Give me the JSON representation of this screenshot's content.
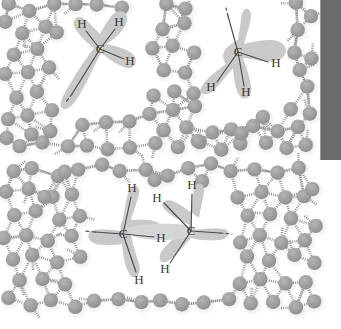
{
  "figure": {
    "width": 341,
    "height": 329,
    "background": "#ffffff",
    "colors": {
      "water_sphere": "#9d9d9d",
      "water_halo": "#d8d8d8",
      "hydration_cage": "#c9c9c9",
      "hydration_cage_inner": "#d5d5d5",
      "bond": "#4a4a4a",
      "hydrogen_bond": "#8f8f8f",
      "label_text": "#3a3a3a",
      "edge_bar": "#6b6b6b"
    }
  },
  "panels": [
    {
      "id": "top-panel",
      "name": "two-separate-methyl-groups-in-water",
      "bounds": {
        "x": 0,
        "y": 0,
        "width": 320,
        "height": 158
      },
      "molecules": [
        {
          "id": "top-left-molecule",
          "center": {
            "x": 100,
            "y": 49
          },
          "carbon_label": "C",
          "hydrogens": [
            {
              "label": "H",
              "x": 82,
              "y": 25
            },
            {
              "label": "H",
              "x": 118,
              "y": 23
            },
            {
              "label": "H",
              "x": 129,
              "y": 61
            }
          ],
          "open_bond": {
            "x": 68,
            "y": 99,
            "style": "dashed-continuation"
          }
        },
        {
          "id": "top-right-molecule",
          "center": {
            "x": 238,
            "y": 52
          },
          "carbon_label": "C",
          "hydrogens": [
            {
              "label": "H",
              "x": 275,
              "y": 64
            },
            {
              "label": "H",
              "x": 211,
              "y": 87
            },
            {
              "label": "H",
              "x": 245,
              "y": 92
            }
          ],
          "open_bond": {
            "x": 227,
            "y": 11,
            "style": "dashed-continuation"
          }
        }
      ]
    },
    {
      "id": "bottom-panel",
      "name": "two-bonded-carbons-in-water",
      "bounds": {
        "x": 0,
        "y": 162,
        "width": 320,
        "height": 158
      },
      "molecules": [
        {
          "id": "bottom-left-carbon",
          "center": {
            "x": 123,
            "y": 234
          },
          "carbon_label": "C",
          "hydrogens": [
            {
              "label": "H",
              "x": 132,
              "y": 190
            },
            {
              "label": "H",
              "x": 161,
              "y": 239
            },
            {
              "label": "H",
              "x": 139,
              "y": 280
            }
          ],
          "open_bond": {
            "x": 83,
            "y": 231,
            "style": "dashed-continuation"
          }
        },
        {
          "id": "bottom-right-carbon",
          "center": {
            "x": 191,
            "y": 231
          },
          "carbon_label": "C",
          "hydrogens": [
            {
              "label": "H",
              "x": 192,
              "y": 186
            },
            {
              "label": "H",
              "x": 157,
              "y": 200
            },
            {
              "label": "H",
              "x": 165,
              "y": 270
            }
          ],
          "open_bond": {
            "x": 231,
            "y": 234,
            "style": "dashed-continuation"
          }
        }
      ]
    }
  ],
  "labels": {
    "carbon": "C",
    "hydrogen": "H"
  },
  "edge_bar": {
    "name": "page-edge-artifact",
    "x": 320,
    "y": 0,
    "width": 21,
    "height": 160,
    "color": "#6b6b6b"
  },
  "water": {
    "sphere_radius": 7.2,
    "halo_radius": 9.4,
    "count_top": 96,
    "count_bottom": 96,
    "top_positions": [
      [
        10,
        6
      ],
      [
        31,
        12
      ],
      [
        54,
        6
      ],
      [
        76,
        3
      ],
      [
        98,
        5
      ],
      [
        20,
        32
      ],
      [
        44,
        27
      ],
      [
        12,
        53
      ],
      [
        35,
        48
      ],
      [
        58,
        30
      ],
      [
        4,
        75
      ],
      [
        27,
        70
      ],
      [
        50,
        66
      ],
      [
        15,
        96
      ],
      [
        38,
        92
      ],
      [
        60,
        88
      ],
      [
        8,
        118
      ],
      [
        30,
        113
      ],
      [
        52,
        110
      ],
      [
        74,
        106
      ],
      [
        96,
        103
      ],
      [
        118,
        99
      ],
      [
        140,
        95
      ],
      [
        84,
        127
      ],
      [
        106,
        123
      ],
      [
        128,
        120
      ],
      [
        150,
        116
      ],
      [
        172,
        112
      ],
      [
        194,
        108
      ],
      [
        120,
        6
      ],
      [
        142,
        10
      ],
      [
        164,
        4
      ],
      [
        186,
        8
      ],
      [
        208,
        3
      ],
      [
        230,
        7
      ],
      [
        252,
        4
      ],
      [
        274,
        9
      ],
      [
        296,
        5
      ],
      [
        163,
        28
      ],
      [
        185,
        24
      ],
      [
        207,
        30
      ],
      [
        229,
        26
      ],
      [
        296,
        28
      ],
      [
        152,
        49
      ],
      [
        174,
        45
      ],
      [
        196,
        51
      ],
      [
        273,
        31
      ],
      [
        295,
        52
      ],
      [
        141,
        72
      ],
      [
        163,
        68
      ],
      [
        185,
        74
      ],
      [
        207,
        70
      ],
      [
        276,
        76
      ],
      [
        298,
        72
      ],
      [
        152,
        94
      ],
      [
        174,
        90
      ],
      [
        196,
        96
      ],
      [
        218,
        92
      ],
      [
        240,
        88
      ],
      [
        262,
        94
      ],
      [
        284,
        90
      ],
      [
        306,
        86
      ],
      [
        166,
        131
      ],
      [
        188,
        127
      ],
      [
        210,
        133
      ],
      [
        232,
        129
      ],
      [
        254,
        125
      ],
      [
        276,
        131
      ],
      [
        298,
        127
      ],
      [
        66,
        148
      ],
      [
        88,
        144
      ],
      [
        110,
        150
      ],
      [
        132,
        146
      ],
      [
        154,
        142
      ],
      [
        176,
        148
      ],
      [
        198,
        144
      ],
      [
        220,
        150
      ],
      [
        242,
        146
      ],
      [
        264,
        142
      ],
      [
        286,
        148
      ],
      [
        308,
        144
      ],
      [
        44,
        140
      ],
      [
        22,
        145
      ],
      [
        5,
        138
      ],
      [
        308,
        112
      ],
      [
        310,
        60
      ],
      [
        312,
        14
      ],
      [
        252,
        46
      ],
      [
        262,
        116
      ],
      [
        240,
        134
      ],
      [
        196,
        140
      ],
      [
        74,
        50
      ],
      [
        96,
        76
      ],
      [
        118,
        56
      ],
      [
        7,
        22
      ],
      [
        52,
        130
      ],
      [
        30,
        135
      ],
      [
        292,
        110
      ]
    ],
    "bottom_positions": [
      [
        12,
        172
      ],
      [
        34,
        168
      ],
      [
        56,
        174
      ],
      [
        78,
        170
      ],
      [
        100,
        166
      ],
      [
        122,
        172
      ],
      [
        144,
        168
      ],
      [
        166,
        174
      ],
      [
        188,
        170
      ],
      [
        210,
        166
      ],
      [
        232,
        172
      ],
      [
        254,
        168
      ],
      [
        276,
        174
      ],
      [
        298,
        170
      ],
      [
        6,
        194
      ],
      [
        28,
        190
      ],
      [
        50,
        196
      ],
      [
        72,
        192
      ],
      [
        240,
        196
      ],
      [
        262,
        192
      ],
      [
        284,
        198
      ],
      [
        306,
        194
      ],
      [
        14,
        216
      ],
      [
        36,
        212
      ],
      [
        58,
        218
      ],
      [
        80,
        214
      ],
      [
        248,
        218
      ],
      [
        270,
        214
      ],
      [
        292,
        220
      ],
      [
        4,
        238
      ],
      [
        26,
        234
      ],
      [
        48,
        240
      ],
      [
        70,
        236
      ],
      [
        238,
        240
      ],
      [
        260,
        236
      ],
      [
        282,
        242
      ],
      [
        304,
        238
      ],
      [
        12,
        260
      ],
      [
        34,
        256
      ],
      [
        56,
        262
      ],
      [
        78,
        258
      ],
      [
        100,
        254
      ],
      [
        226,
        258
      ],
      [
        248,
        254
      ],
      [
        270,
        260
      ],
      [
        292,
        256
      ],
      [
        20,
        282
      ],
      [
        42,
        278
      ],
      [
        64,
        284
      ],
      [
        86,
        280
      ],
      [
        108,
        276
      ],
      [
        130,
        282
      ],
      [
        152,
        278
      ],
      [
        174,
        284
      ],
      [
        196,
        280
      ],
      [
        218,
        276
      ],
      [
        240,
        282
      ],
      [
        262,
        278
      ],
      [
        284,
        284
      ],
      [
        306,
        280
      ],
      [
        30,
        304
      ],
      [
        52,
        300
      ],
      [
        74,
        306
      ],
      [
        96,
        302
      ],
      [
        118,
        298
      ],
      [
        140,
        304
      ],
      [
        162,
        300
      ],
      [
        184,
        306
      ],
      [
        206,
        302
      ],
      [
        228,
        298
      ],
      [
        250,
        304
      ],
      [
        272,
        300
      ],
      [
        294,
        306
      ],
      [
        312,
        188
      ],
      [
        314,
        226
      ],
      [
        316,
        264
      ],
      [
        90,
        192
      ],
      [
        112,
        188
      ],
      [
        134,
        184
      ],
      [
        156,
        180
      ],
      [
        178,
        186
      ],
      [
        200,
        182
      ],
      [
        222,
        188
      ],
      [
        216,
        212
      ],
      [
        204,
        262
      ],
      [
        182,
        266
      ],
      [
        110,
        238
      ],
      [
        92,
        216
      ],
      [
        8,
        300
      ],
      [
        312,
        300
      ],
      [
        66,
        174
      ],
      [
        44,
        196
      ],
      [
        88,
        258
      ],
      [
        112,
        258
      ],
      [
        134,
        260
      ],
      [
        156,
        258
      ],
      [
        178,
        256
      ],
      [
        200,
        258
      ],
      [
        222,
        236
      ]
    ]
  }
}
